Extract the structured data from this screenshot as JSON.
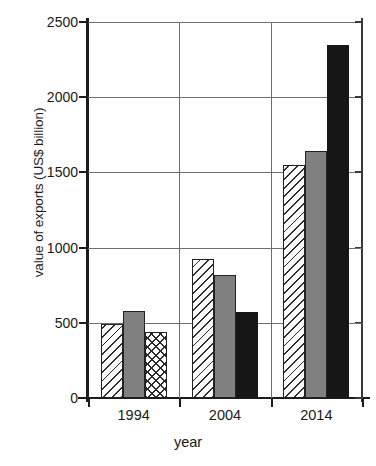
{
  "chart_data": {
    "type": "bar",
    "title": "",
    "subtitle": "",
    "xlabel": "year",
    "ylabel": "value of exports (US$ billion)",
    "categories": [
      "1994",
      "2004",
      "2014"
    ],
    "series": [
      {
        "name": "series-1",
        "pattern": "diagonal-hatch",
        "values": [
          490,
          925,
          1550
        ]
      },
      {
        "name": "series-2",
        "pattern": "solid-gray",
        "values": [
          580,
          820,
          1640
        ]
      },
      {
        "name": "series-3",
        "pattern": "crosshatch-then-solid-black",
        "values": [
          440,
          570,
          2350
        ]
      }
    ],
    "bar_patterns": [
      [
        "diagonal",
        "solid-gray",
        "crosshatch"
      ],
      [
        "diagonal",
        "solid-gray",
        "solid-black"
      ],
      [
        "diagonal",
        "solid-gray",
        "solid-black"
      ]
    ],
    "ylim": [
      0,
      2500
    ],
    "ytick_labels": [
      "0",
      "500",
      "1000",
      "1500",
      "2000",
      "2500"
    ],
    "ytick_values": [
      0,
      500,
      1000,
      1500,
      2000,
      2500
    ],
    "grid": "horizontal-and-vertical",
    "legend": "none",
    "legend_position": "none",
    "colors": {
      "gray_bar": "#808080",
      "black_bar": "#161616",
      "hatch_line": "#2a2a2a",
      "bar_fill": "#fdfdfd",
      "axis": "#1c1c1c",
      "gridline": "#6f6f6f",
      "text": "#1a1a1a",
      "background": "#ffffff"
    }
  }
}
